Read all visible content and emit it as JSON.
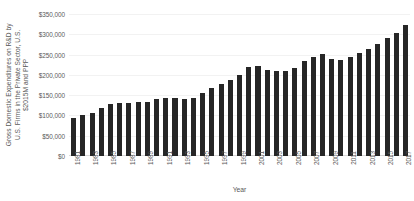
{
  "chart_data": {
    "type": "bar",
    "title": "",
    "xlabel": "Year",
    "ylabel": "Gross Domestic Expenditures on R&D by U.S. Firms in the Private Sector, U.S. $2015M and PPP",
    "ylabel_lines": [
      "Gross Domestic Expenditures on R&D by",
      "U.S. Firms in the Private Sector, U.S.",
      "$2015M and PPP"
    ],
    "ylim": [
      0,
      350000
    ],
    "ytick_labels": [
      "$0",
      "$50,000",
      "$100,000",
      "$150,000",
      "$200,000",
      "$250,000",
      "$300,000",
      "$350,000"
    ],
    "ytick_values": [
      0,
      50000,
      100000,
      150000,
      200000,
      250000,
      300000,
      350000
    ],
    "grid": true,
    "legend": "none",
    "bar_color": "#262626",
    "grid_color": "#F2F2F2",
    "text_color": "#595959",
    "background": "#FFFFFF",
    "xtick_interval": 2,
    "categories": [
      "1981",
      "1982",
      "1983",
      "1984",
      "1985",
      "1986",
      "1987",
      "1988",
      "1989",
      "1990",
      "1991",
      "1992",
      "1993",
      "1994",
      "1995",
      "1996",
      "1997",
      "1998",
      "1999",
      "2000",
      "2001",
      "2002",
      "2003",
      "2004",
      "2005",
      "2006",
      "2007",
      "2008",
      "2009",
      "2010",
      "2011",
      "2012",
      "2013",
      "2014",
      "2015",
      "2016",
      "2017"
    ],
    "values": [
      94000,
      100000,
      107000,
      118000,
      128000,
      130000,
      131000,
      134000,
      134000,
      140000,
      144000,
      143000,
      141000,
      144000,
      155000,
      167000,
      177000,
      187000,
      199000,
      219000,
      222000,
      211000,
      210000,
      209000,
      218000,
      233000,
      245000,
      252000,
      238000,
      237000,
      245000,
      254000,
      263000,
      275000,
      290000,
      302000,
      323000
    ]
  }
}
